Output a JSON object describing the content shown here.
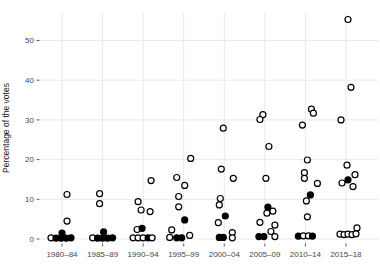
{
  "colors": {
    "background": "#ffffff",
    "grid": "#e9e9e9",
    "tick": "#333333",
    "tick_text": "#474747",
    "point_stroke": "#000000",
    "open_fill": "#ffffff",
    "filled_fill": "#000000"
  },
  "chart_data": {
    "type": "scatter",
    "title": "",
    "xlabel": "",
    "ylabel": "Percentage of the votes",
    "categories": [
      "1980–84",
      "1985–89",
      "1990–94",
      "1995–99",
      "2000–04",
      "2005–09",
      "2010–14",
      "2015–18"
    ],
    "yticks": [
      0,
      10,
      20,
      30,
      40,
      50
    ],
    "ylim": [
      0,
      57
    ],
    "grid": true,
    "legend": "none",
    "point_styles": [
      "open",
      "filled"
    ],
    "points": [
      {
        "period": "1980–84",
        "value": 11.2,
        "style": "open",
        "dx": 5
      },
      {
        "period": "1980–84",
        "value": 4.5,
        "style": "open",
        "dx": 5
      },
      {
        "period": "1980–84",
        "value": 0.3,
        "style": "open",
        "dx": -11
      },
      {
        "period": "1980–84",
        "value": 0.2,
        "style": "filled",
        "dx": -6
      },
      {
        "period": "1980–84",
        "value": 0.2,
        "style": "filled",
        "dx": -1
      },
      {
        "period": "1980–84",
        "value": 0.2,
        "style": "filled",
        "dx": 4
      },
      {
        "period": "1980–84",
        "value": 0.3,
        "style": "filled",
        "dx": 9
      },
      {
        "period": "1980–84",
        "value": 1.5,
        "style": "filled",
        "dx": 0
      },
      {
        "period": "1985–89",
        "value": 11.4,
        "style": "open",
        "dx": -3
      },
      {
        "period": "1985–89",
        "value": 8.9,
        "style": "open",
        "dx": -3
      },
      {
        "period": "1985–89",
        "value": 0.3,
        "style": "open",
        "dx": -10
      },
      {
        "period": "1985–89",
        "value": 0.2,
        "style": "filled",
        "dx": -5
      },
      {
        "period": "1985–89",
        "value": 0.2,
        "style": "filled",
        "dx": 0
      },
      {
        "period": "1985–89",
        "value": 0.2,
        "style": "filled",
        "dx": 5
      },
      {
        "period": "1985–89",
        "value": 0.3,
        "style": "filled",
        "dx": 10
      },
      {
        "period": "1985–89",
        "value": 1.8,
        "style": "filled",
        "dx": 1
      },
      {
        "period": "1990–94",
        "value": 14.7,
        "style": "open",
        "dx": 8
      },
      {
        "period": "1990–94",
        "value": 9.4,
        "style": "open",
        "dx": -5
      },
      {
        "period": "1990–94",
        "value": 7.3,
        "style": "open",
        "dx": -2
      },
      {
        "period": "1990–94",
        "value": 6.9,
        "style": "open",
        "dx": 7
      },
      {
        "period": "1990–94",
        "value": 2.4,
        "style": "open",
        "dx": -6
      },
      {
        "period": "1990–94",
        "value": 2.7,
        "style": "filled",
        "dx": -1
      },
      {
        "period": "1990–94",
        "value": 0.3,
        "style": "open",
        "dx": -10
      },
      {
        "period": "1990–94",
        "value": 0.3,
        "style": "open",
        "dx": -5
      },
      {
        "period": "1990–94",
        "value": 0.3,
        "style": "open",
        "dx": 0
      },
      {
        "period": "1990–94",
        "value": 0.3,
        "style": "filled",
        "dx": 5
      },
      {
        "period": "1990–94",
        "value": 0.3,
        "style": "open",
        "dx": 9
      },
      {
        "period": "1995–99",
        "value": 20.3,
        "style": "open",
        "dx": 7
      },
      {
        "period": "1995–99",
        "value": 15.5,
        "style": "open",
        "dx": -7
      },
      {
        "period": "1995–99",
        "value": 13.5,
        "style": "open",
        "dx": 1
      },
      {
        "period": "1995–99",
        "value": 10.7,
        "style": "open",
        "dx": -5
      },
      {
        "period": "1995–99",
        "value": 8.1,
        "style": "open",
        "dx": -5
      },
      {
        "period": "1995–99",
        "value": 4.8,
        "style": "filled",
        "dx": 1
      },
      {
        "period": "1995–99",
        "value": 2.3,
        "style": "open",
        "dx": -12
      },
      {
        "period": "1995–99",
        "value": 0.4,
        "style": "open",
        "dx": -14
      },
      {
        "period": "1995–99",
        "value": 0.3,
        "style": "filled",
        "dx": -7
      },
      {
        "period": "1995–99",
        "value": 0.3,
        "style": "filled",
        "dx": -2
      },
      {
        "period": "1995–99",
        "value": 0.9,
        "style": "open",
        "dx": 6
      },
      {
        "period": "2000–04",
        "value": 27.9,
        "style": "open",
        "dx": -1
      },
      {
        "period": "2000–04",
        "value": 17.6,
        "style": "open",
        "dx": -3
      },
      {
        "period": "2000–04",
        "value": 15.3,
        "style": "open",
        "dx": 9
      },
      {
        "period": "2000–04",
        "value": 10.2,
        "style": "open",
        "dx": -4
      },
      {
        "period": "2000–04",
        "value": 8.6,
        "style": "open",
        "dx": -5
      },
      {
        "period": "2000–04",
        "value": 5.8,
        "style": "filled",
        "dx": 1
      },
      {
        "period": "2000–04",
        "value": 4.1,
        "style": "open",
        "dx": -6
      },
      {
        "period": "2000–04",
        "value": 1.6,
        "style": "open",
        "dx": 8
      },
      {
        "period": "2000–04",
        "value": 0.4,
        "style": "filled",
        "dx": -5
      },
      {
        "period": "2000–04",
        "value": 0.4,
        "style": "filled",
        "dx": -1
      },
      {
        "period": "2000–04",
        "value": 0.3,
        "style": "open",
        "dx": 8
      },
      {
        "period": "2005–09",
        "value": 31.3,
        "style": "open",
        "dx": -2
      },
      {
        "period": "2005–09",
        "value": 30.1,
        "style": "open",
        "dx": -5
      },
      {
        "period": "2005–09",
        "value": 23.3,
        "style": "open",
        "dx": 4
      },
      {
        "period": "2005–09",
        "value": 15.3,
        "style": "open",
        "dx": 1
      },
      {
        "period": "2005–09",
        "value": 8.0,
        "style": "filled",
        "dx": 3
      },
      {
        "period": "2005–09",
        "value": 7.0,
        "style": "open",
        "dx": 8
      },
      {
        "period": "2005–09",
        "value": 6.5,
        "style": "open",
        "dx": 2
      },
      {
        "period": "2005–09",
        "value": 4.2,
        "style": "open",
        "dx": -5
      },
      {
        "period": "2005–09",
        "value": 3.5,
        "style": "open",
        "dx": 10
      },
      {
        "period": "2005–09",
        "value": 1.9,
        "style": "open",
        "dx": 6
      },
      {
        "period": "2005–09",
        "value": 0.6,
        "style": "filled",
        "dx": -6
      },
      {
        "period": "2005–09",
        "value": 0.6,
        "style": "filled",
        "dx": -1
      },
      {
        "period": "2005–09",
        "value": 0.6,
        "style": "open",
        "dx": 10
      },
      {
        "period": "2010–14",
        "value": 32.7,
        "style": "open",
        "dx": 6
      },
      {
        "period": "2010–14",
        "value": 31.7,
        "style": "open",
        "dx": 8
      },
      {
        "period": "2010–14",
        "value": 28.7,
        "style": "open",
        "dx": -3
      },
      {
        "period": "2010–14",
        "value": 19.9,
        "style": "open",
        "dx": 2
      },
      {
        "period": "2010–14",
        "value": 16.7,
        "style": "open",
        "dx": -1
      },
      {
        "period": "2010–14",
        "value": 15.3,
        "style": "open",
        "dx": -1
      },
      {
        "period": "2010–14",
        "value": 14.0,
        "style": "open",
        "dx": 12
      },
      {
        "period": "2010–14",
        "value": 11.1,
        "style": "filled",
        "dx": 5
      },
      {
        "period": "2010–14",
        "value": 9.6,
        "style": "open",
        "dx": 1
      },
      {
        "period": "2010–14",
        "value": 5.6,
        "style": "open",
        "dx": 2
      },
      {
        "period": "2010–14",
        "value": 0.7,
        "style": "filled",
        "dx": -7
      },
      {
        "period": "2010–14",
        "value": 0.8,
        "style": "open",
        "dx": -2
      },
      {
        "period": "2010–14",
        "value": 0.8,
        "style": "open",
        "dx": 3
      },
      {
        "period": "2010–14",
        "value": 0.7,
        "style": "filled",
        "dx": 7
      },
      {
        "period": "2015–18",
        "value": 55.3,
        "style": "open",
        "dx": 2
      },
      {
        "period": "2015–18",
        "value": 38.2,
        "style": "open",
        "dx": 5
      },
      {
        "period": "2015–18",
        "value": 30.0,
        "style": "open",
        "dx": -5
      },
      {
        "period": "2015–18",
        "value": 18.6,
        "style": "open",
        "dx": 1
      },
      {
        "period": "2015–18",
        "value": 16.2,
        "style": "open",
        "dx": 9
      },
      {
        "period": "2015–18",
        "value": 14.9,
        "style": "filled",
        "dx": 2
      },
      {
        "period": "2015–18",
        "value": 14.1,
        "style": "open",
        "dx": -4
      },
      {
        "period": "2015–18",
        "value": 13.2,
        "style": "open",
        "dx": 7
      },
      {
        "period": "2015–18",
        "value": 2.8,
        "style": "open",
        "dx": 11
      },
      {
        "period": "2015–18",
        "value": 1.2,
        "style": "open",
        "dx": -6
      },
      {
        "period": "2015–18",
        "value": 1.1,
        "style": "open",
        "dx": -2
      },
      {
        "period": "2015–18",
        "value": 1.2,
        "style": "open",
        "dx": 2
      },
      {
        "period": "2015–18",
        "value": 1.1,
        "style": "open",
        "dx": 6
      },
      {
        "period": "2015–18",
        "value": 1.3,
        "style": "open",
        "dx": 10
      }
    ]
  }
}
